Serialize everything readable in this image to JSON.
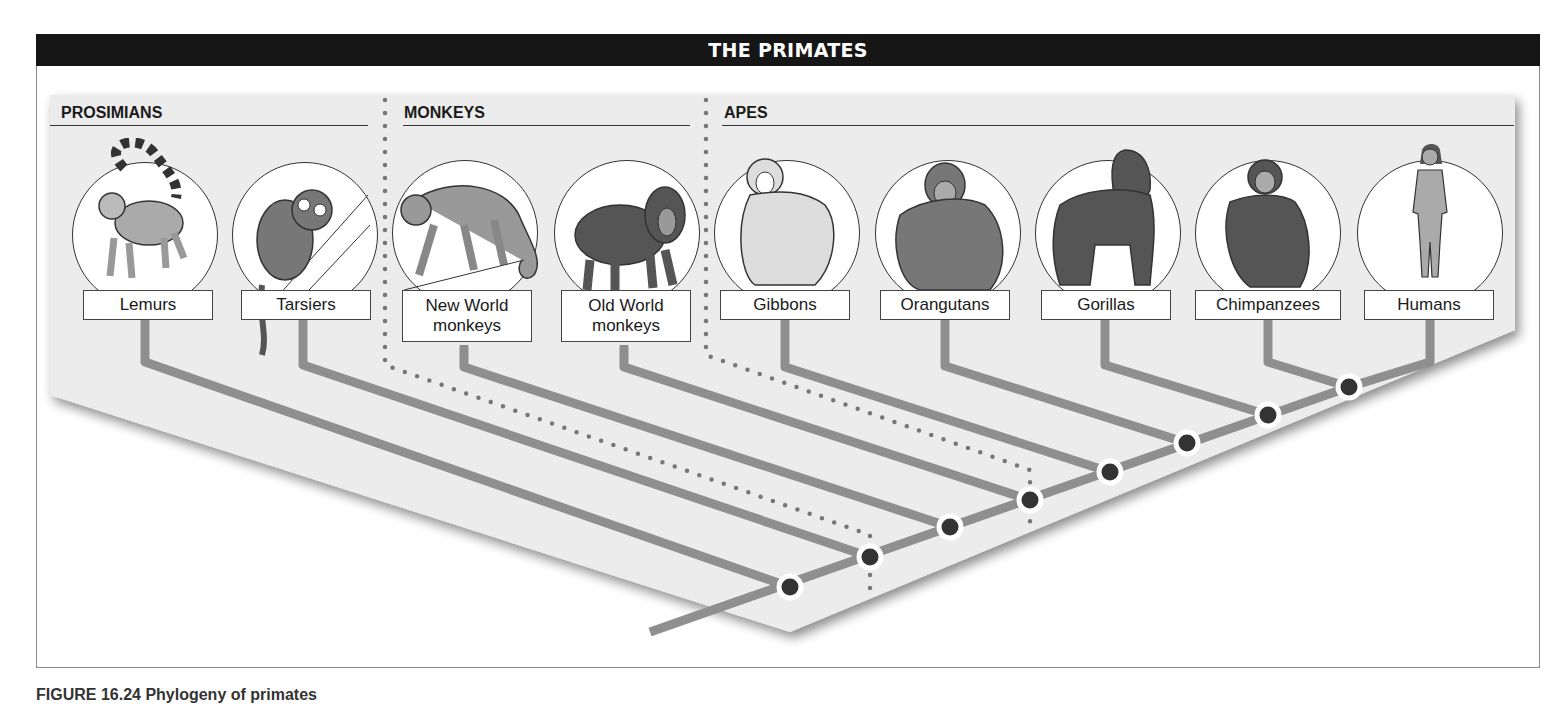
{
  "header": {
    "title": "THE PRIMATES"
  },
  "groups": [
    {
      "label": "PROSIMIANS"
    },
    {
      "label": "MONKEYS"
    },
    {
      "label": "APES"
    }
  ],
  "taxa": [
    {
      "label": "Lemurs",
      "icon": "lemur-icon"
    },
    {
      "label": "Tarsiers",
      "icon": "tarsier-icon"
    },
    {
      "label": "New World monkeys",
      "line1": "New World",
      "line2": "monkeys",
      "icon": "new-world-monkey-icon"
    },
    {
      "label": "Old World monkeys",
      "line1": "Old World",
      "line2": "monkeys",
      "icon": "old-world-monkey-icon"
    },
    {
      "label": "Gibbons",
      "icon": "gibbon-icon"
    },
    {
      "label": "Orangutans",
      "icon": "orangutan-icon"
    },
    {
      "label": "Gorillas",
      "icon": "gorilla-icon"
    },
    {
      "label": "Chimpanzees",
      "icon": "chimpanzee-icon"
    },
    {
      "label": "Humans",
      "icon": "human-icon"
    }
  ],
  "caption": {
    "text": "FIGURE 16.24 Phylogeny of primates"
  },
  "colors": {
    "header_bg": "#161616",
    "panel_bg": "#ececec",
    "branch": "#8f8f8f",
    "node": "#333333",
    "dotted": "#777777"
  }
}
